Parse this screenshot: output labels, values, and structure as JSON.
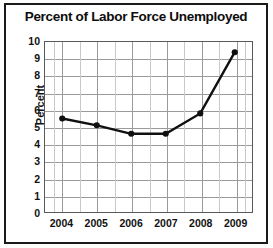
{
  "chart_data": {
    "type": "line",
    "title": "Percent of Labor Force Unemployed",
    "xlabel": "",
    "ylabel": "Percent",
    "categories": [
      "2004",
      "2005",
      "2006",
      "2007",
      "2008",
      "2009"
    ],
    "values": [
      5.5,
      5.1,
      4.6,
      4.6,
      5.8,
      9.4
    ],
    "series": [
      {
        "name": "Percent of Labor Force Unemployed",
        "values": [
          5.5,
          5.1,
          4.6,
          4.6,
          5.8,
          9.4
        ]
      }
    ],
    "ylim": [
      0,
      10
    ],
    "ytick_step": 1,
    "ytick_labels": [
      "10",
      "9",
      "8",
      "7",
      "6",
      "5",
      "4",
      "3",
      "2",
      "1",
      "0"
    ],
    "xtick_labels": [
      "2004",
      "2005",
      "2006",
      "2007",
      "2008",
      "2009"
    ],
    "grid": true,
    "minor_vertical_grid": true,
    "legend": false,
    "legend_position": "none",
    "marker": "circle",
    "line_color": "#101010",
    "grid_color": "#9a9a9a",
    "border_color": "#1a1a1a"
  }
}
